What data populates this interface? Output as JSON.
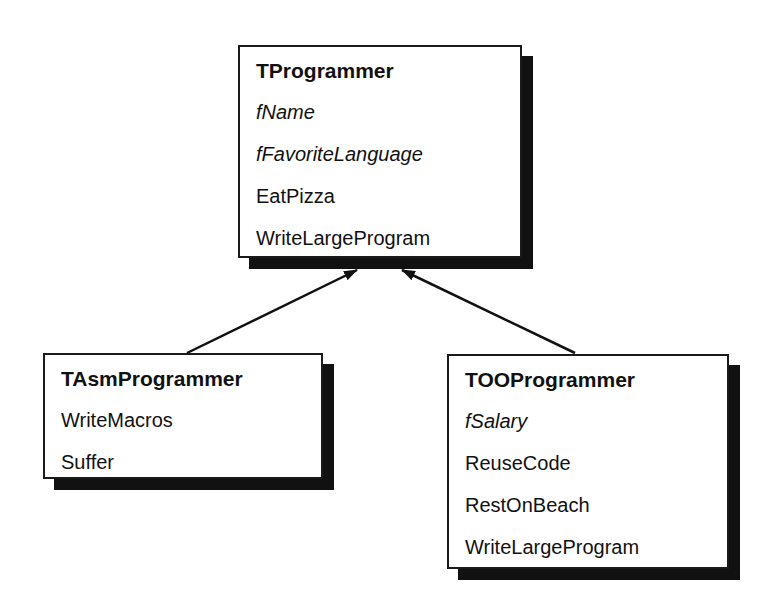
{
  "diagram": {
    "type": "class-inheritance",
    "classes": {
      "base": {
        "name": "TProgrammer",
        "fields": [
          "fName",
          "fFavoriteLanguage"
        ],
        "methods": [
          "EatPizza",
          "WriteLargeProgram"
        ]
      },
      "asm": {
        "name": "TAsmProgrammer",
        "fields": [],
        "methods": [
          "WriteMacros",
          "Suffer"
        ],
        "inherits": "TProgrammer"
      },
      "oo": {
        "name": "TOOProgrammer",
        "fields": [
          "fSalary"
        ],
        "methods": [
          "ReuseCode",
          "RestOnBeach",
          "WriteLargeProgram"
        ],
        "inherits": "TProgrammer"
      }
    },
    "edges": [
      {
        "from": "TAsmProgrammer",
        "to": "TProgrammer",
        "kind": "inheritance-arrow"
      },
      {
        "from": "TOOProgrammer",
        "to": "TProgrammer",
        "kind": "inheritance-arrow"
      }
    ],
    "colors": {
      "border": "#1a1a1a",
      "shadow": "#111111",
      "background": "#ffffff"
    }
  }
}
